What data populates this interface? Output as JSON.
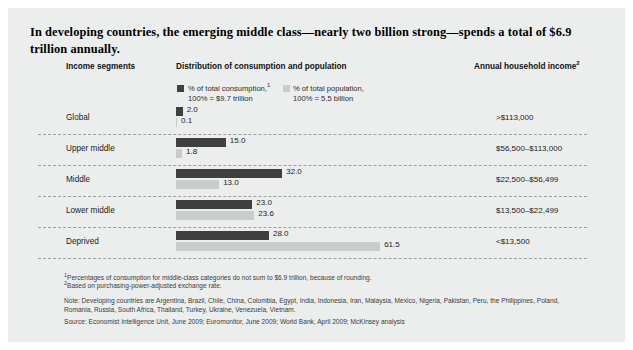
{
  "title": "In developing countries, the emerging middle class—nearly two billion strong—spends a total of $6.9 trillion annually.",
  "headers": {
    "income_segments": "Income segments",
    "distribution": "Distribution of consumption and population",
    "annual_income": "Annual household income",
    "annual_income_sup": "2"
  },
  "legend": [
    {
      "name": "consumption",
      "line1": "% of total consumption,",
      "sup": "1",
      "line2": "100% = $9.7 trillion",
      "color": "#3f3f3f"
    },
    {
      "name": "population",
      "line1": "% of total population,",
      "sup": "",
      "line2": "100% = 5.5 billion",
      "color": "#c9cccc"
    }
  ],
  "chart_data": {
    "type": "bar",
    "title": "In developing countries, the emerging middle class—nearly two billion strong—spends a total of $6.9 trillion annually.",
    "orientation": "horizontal",
    "categories": [
      "Global",
      "Upper middle",
      "Middle",
      "Lower middle",
      "Deprived"
    ],
    "series": [
      {
        "name": "% of total consumption,¹ 100% = $9.7 trillion",
        "color": "#3f3f3f",
        "values": [
          2.0,
          15.0,
          32.0,
          23.0,
          28.0
        ],
        "labels": [
          "2.0",
          "15.0",
          "32.0",
          "23.0",
          "28.0"
        ]
      },
      {
        "name": "% of total population, 100% = 5.5 billion",
        "color": "#c9cccc",
        "values": [
          0.1,
          1.8,
          13.0,
          23.6,
          61.5
        ],
        "labels": [
          "0.1",
          "1.8",
          "13.0",
          "23.6",
          "61.5"
        ]
      }
    ],
    "annual_household_income": [
      ">$113,000",
      "$56,500–$113,000",
      "$22,500–$56,499",
      "$13,500–$22,499",
      "<$13,500"
    ],
    "xlabel": "",
    "ylabel": "Income segments",
    "xlim": [
      0,
      61.5
    ],
    "grid": false,
    "legend_position": "top"
  },
  "rows": [
    {
      "segment": "Global",
      "consumption": "2.0",
      "population": "0.1",
      "income": ">$113,000"
    },
    {
      "segment": "Upper middle",
      "consumption": "15.0",
      "population": "1.8",
      "income": "$56,500–$113,000"
    },
    {
      "segment": "Middle",
      "consumption": "32.0",
      "population": "13.0",
      "income": "$22,500–$56,499"
    },
    {
      "segment": "Lower middle",
      "consumption": "23.0",
      "population": "23.6",
      "income": "$13,500–$22,499"
    },
    {
      "segment": "Deprived",
      "consumption": "28.0",
      "population": "61.5",
      "income": "<$13,500"
    }
  ],
  "footnotes": {
    "fn1_sup": "1",
    "fn1": "Percentages of consumption for middle-class categories do not sum to $6.9 trillion, because of rounding.",
    "fn2_sup": "2",
    "fn2": "Based on purchasing-power-adjusted exchange rate.",
    "note": "Note: Developing countries are Argentina, Brazil, Chile, China, Colombia, Egypt, India, Indonesia, Iran, Malaysia, Mexico, Nigeria, Pakistan, Peru, the Philippines, Poland, Romania, Russia, South Africa, Thailand, Turkey, Ukraine, Venezuela, Vietnam.",
    "source": "Source: Economist Intelligence Unit, June 2009; Euromonitor,  June 2009; World Bank, April 2009; McKinsey analysis"
  },
  "colors": {
    "background": "#eceeee",
    "dark_bar": "#3f3f3f",
    "light_bar": "#c9cccc",
    "divider": "#9aa0a0"
  }
}
